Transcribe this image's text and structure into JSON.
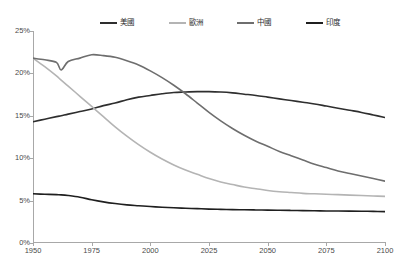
{
  "chart_data": {
    "type": "line",
    "title": "",
    "subtitle": "",
    "xlabel": "",
    "ylabel": "",
    "xlim": [
      1950,
      2100
    ],
    "ylim": [
      0,
      25
    ],
    "grid": false,
    "legend_position": "top",
    "y_tick_labels": [
      "25%",
      "20%",
      "15%",
      "10%",
      "5%",
      "0%"
    ],
    "y_tick_values": [
      25,
      20,
      15,
      10,
      5,
      0
    ],
    "x_tick_labels": [
      "1950",
      "1975",
      "2000",
      "2025",
      "2050",
      "2075",
      "2100"
    ],
    "x_tick_values": [
      1950,
      1975,
      2000,
      2025,
      2050,
      2075,
      2100
    ],
    "x": [
      1950,
      1955,
      1960,
      1962,
      1965,
      1970,
      1975,
      1980,
      1985,
      1990,
      1995,
      2000,
      2005,
      2010,
      2015,
      2020,
      2025,
      2030,
      2035,
      2040,
      2045,
      2050,
      2055,
      2060,
      2065,
      2070,
      2075,
      2080,
      2085,
      2090,
      2095,
      2100
    ],
    "series": [
      {
        "name": "美國",
        "color": "#2e2e2e",
        "values": [
          14.3,
          14.6,
          14.9,
          15.0,
          15.2,
          15.5,
          15.8,
          16.2,
          16.5,
          16.9,
          17.2,
          17.4,
          17.6,
          17.75,
          17.8,
          17.85,
          17.85,
          17.8,
          17.7,
          17.55,
          17.4,
          17.2,
          17.0,
          16.8,
          16.6,
          16.4,
          16.15,
          15.9,
          15.65,
          15.4,
          15.1,
          14.8
        ]
      },
      {
        "name": "歐洲",
        "color": "#b4b4b4",
        "values": [
          21.8,
          20.8,
          19.7,
          19.2,
          18.5,
          17.3,
          16.1,
          14.9,
          13.7,
          12.6,
          11.6,
          10.7,
          9.9,
          9.2,
          8.6,
          8.1,
          7.6,
          7.2,
          6.9,
          6.6,
          6.4,
          6.2,
          6.05,
          5.95,
          5.85,
          5.8,
          5.75,
          5.7,
          5.65,
          5.6,
          5.55,
          5.5
        ]
      },
      {
        "name": "中國",
        "color": "#6e6e6e",
        "values": [
          21.8,
          21.6,
          21.3,
          20.4,
          21.4,
          21.8,
          22.2,
          22.1,
          21.9,
          21.5,
          21.0,
          20.3,
          19.5,
          18.6,
          17.6,
          16.5,
          15.4,
          14.4,
          13.5,
          12.7,
          12.0,
          11.4,
          10.8,
          10.3,
          9.8,
          9.3,
          8.9,
          8.5,
          8.2,
          7.9,
          7.6,
          7.3
        ]
      },
      {
        "name": "印度",
        "color": "#1f1f1f",
        "values": [
          5.8,
          5.75,
          5.7,
          5.68,
          5.6,
          5.4,
          5.1,
          4.85,
          4.65,
          4.5,
          4.4,
          4.3,
          4.22,
          4.15,
          4.1,
          4.05,
          4.0,
          3.97,
          3.94,
          3.92,
          3.9,
          3.88,
          3.86,
          3.84,
          3.82,
          3.8,
          3.78,
          3.77,
          3.76,
          3.75,
          3.73,
          3.7
        ]
      }
    ]
  },
  "legend": {
    "items": [
      {
        "label": "美國",
        "color": "#2e2e2e"
      },
      {
        "label": "歐洲",
        "color": "#b4b4b4"
      },
      {
        "label": "中國",
        "color": "#6e6e6e"
      },
      {
        "label": "印度",
        "color": "#1f1f1f"
      }
    ]
  }
}
